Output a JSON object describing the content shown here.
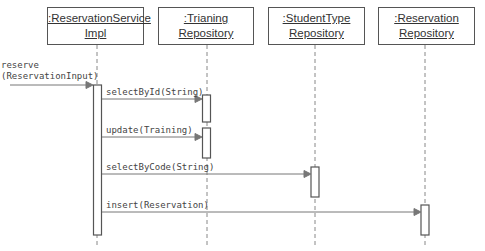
{
  "diagram": {
    "type": "sequence",
    "participants": [
      {
        "id": "p1",
        "line1": ":ReservationService",
        "line2": "Impl",
        "x": 97
      },
      {
        "id": "p2",
        "line1": ":Trianing",
        "line2": "Repository",
        "x": 207
      },
      {
        "id": "p3",
        "line1": ":StudentType",
        "line2": "Repository",
        "x": 315
      },
      {
        "id": "p4",
        "line1": ":Reservation",
        "line2": "Repository",
        "x": 425
      }
    ],
    "messages": [
      {
        "label": "reserve",
        "label2": "(ReservationInput)",
        "from": "external",
        "to": "p1"
      },
      {
        "label": "selectById(String)",
        "from": "p1",
        "to": "p2"
      },
      {
        "label": "update(Training)",
        "from": "p1",
        "to": "p2"
      },
      {
        "label": "selectByCode(String)",
        "from": "p1",
        "to": "p3"
      },
      {
        "label": "insert(Reservation)",
        "from": "p1",
        "to": "p4"
      }
    ],
    "colors": {
      "line": "#555555",
      "arrow": "#777777",
      "text": "#333333"
    }
  }
}
